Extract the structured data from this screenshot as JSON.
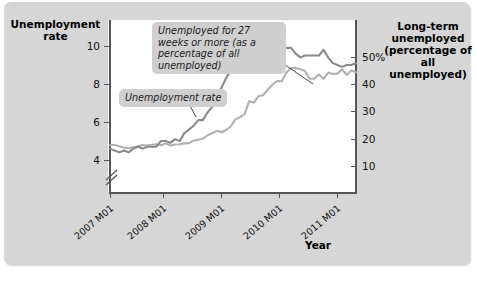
{
  "titles": {
    "left_axis": "Unemployment rate",
    "right_axis": "Long-term unemployed (percentage of all unemployed)",
    "x_axis": "Year"
  },
  "callouts": {
    "long_term": "Unemployed for 27 weeks or more (as a percentage of all unemployed)",
    "unemployment_rate": "Unemployment rate"
  },
  "axes": {
    "left_ticks": [
      "10",
      "8",
      "6",
      "4"
    ],
    "right_ticks": [
      "50%",
      "40",
      "30",
      "20",
      "10"
    ],
    "x_ticks": [
      "2007 M01",
      "2008 M01",
      "2009 M01",
      "2010 M01",
      "2011 M01"
    ]
  },
  "chart_data": {
    "type": "line",
    "title": "",
    "xlabel": "Year",
    "ylabel": "Unemployment rate",
    "y2label": "Long-term unemployed (percentage of all unemployed)",
    "grid": false,
    "legend": "annotations",
    "xlim": [
      "2007 M01",
      "2011 M06"
    ],
    "ylim": [
      3.2,
      11.2
    ],
    "y2lim": [
      5,
      57
    ],
    "x_tick_labels": [
      "2007 M01",
      "2008 M01",
      "2009 M01",
      "2010 M01",
      "2011 M01"
    ],
    "y_tick_values": [
      4,
      6,
      8,
      10
    ],
    "y2_tick_values": [
      10,
      20,
      30,
      40,
      50
    ],
    "axis_break": true,
    "series": [
      {
        "name": "Unemployment rate",
        "axis": "left",
        "color": "#8a8a8a",
        "x": [
          "2007 M01",
          "2007 M02",
          "2007 M03",
          "2007 M04",
          "2007 M05",
          "2007 M06",
          "2007 M07",
          "2007 M08",
          "2007 M09",
          "2007 M10",
          "2007 M11",
          "2007 M12",
          "2008 M01",
          "2008 M02",
          "2008 M03",
          "2008 M04",
          "2008 M05",
          "2008 M06",
          "2008 M07",
          "2008 M08",
          "2008 M09",
          "2008 M10",
          "2008 M11",
          "2008 M12",
          "2009 M01",
          "2009 M02",
          "2009 M03",
          "2009 M04",
          "2009 M05",
          "2009 M06",
          "2009 M07",
          "2009 M08",
          "2009 M09",
          "2009 M10",
          "2009 M11",
          "2009 M12",
          "2010 M01",
          "2010 M02",
          "2010 M03",
          "2010 M04",
          "2010 M05",
          "2010 M06",
          "2010 M07",
          "2010 M08",
          "2010 M09",
          "2010 M10",
          "2010 M11",
          "2010 M12",
          "2011 M01",
          "2011 M02",
          "2011 M03",
          "2011 M04",
          "2011 M05",
          "2011 M06"
        ],
        "values": [
          4.6,
          4.5,
          4.4,
          4.5,
          4.4,
          4.6,
          4.7,
          4.6,
          4.7,
          4.7,
          4.7,
          5.0,
          5.0,
          4.9,
          5.1,
          5.0,
          5.4,
          5.6,
          5.8,
          6.1,
          6.1,
          6.5,
          6.8,
          7.3,
          7.8,
          8.3,
          8.7,
          9.0,
          9.4,
          9.5,
          9.5,
          9.6,
          9.8,
          10.0,
          9.9,
          9.9,
          9.8,
          9.8,
          9.9,
          9.9,
          9.6,
          9.4,
          9.5,
          9.5,
          9.5,
          9.5,
          9.8,
          9.4,
          9.1,
          9.0,
          8.9,
          9.0,
          9.0,
          9.1
        ]
      },
      {
        "name": "Unemployed for 27 weeks or more (as a percentage of all unemployed)",
        "axis": "right",
        "color": "#b0b0b0",
        "x": [
          "2007 M01",
          "2007 M02",
          "2007 M03",
          "2007 M04",
          "2007 M05",
          "2007 M06",
          "2007 M07",
          "2007 M08",
          "2007 M09",
          "2007 M10",
          "2007 M11",
          "2007 M12",
          "2008 M01",
          "2008 M02",
          "2008 M03",
          "2008 M04",
          "2008 M05",
          "2008 M06",
          "2008 M07",
          "2008 M08",
          "2008 M09",
          "2008 M10",
          "2008 M11",
          "2008 M12",
          "2009 M01",
          "2009 M02",
          "2009 M03",
          "2009 M04",
          "2009 M05",
          "2009 M06",
          "2009 M07",
          "2009 M08",
          "2009 M09",
          "2009 M10",
          "2009 M11",
          "2009 M12",
          "2010 M01",
          "2010 M02",
          "2010 M03",
          "2010 M04",
          "2010 M05",
          "2010 M06",
          "2010 M07",
          "2010 M08",
          "2010 M09",
          "2010 M10",
          "2010 M11",
          "2010 M12",
          "2011 M01",
          "2011 M02",
          "2011 M03",
          "2011 M04",
          "2011 M05",
          "2011 M06"
        ],
        "values": [
          17.6,
          17.8,
          17.2,
          16.8,
          16.5,
          16.9,
          17.2,
          17.7,
          17.5,
          17.8,
          18.0,
          17.6,
          18.3,
          17.5,
          17.9,
          18.0,
          18.3,
          18.4,
          19.3,
          19.6,
          20.0,
          21.3,
          22.0,
          22.9,
          22.4,
          23.2,
          24.5,
          27.1,
          27.9,
          29.0,
          33.8,
          33.3,
          35.6,
          36.0,
          38.0,
          39.8,
          41.2,
          41.1,
          44.3,
          45.9,
          46.0,
          45.5,
          44.9,
          42.0,
          42.0,
          43.6,
          42.0,
          44.3,
          43.8,
          43.9,
          45.5,
          43.4,
          45.1,
          44.4
        ]
      }
    ]
  }
}
